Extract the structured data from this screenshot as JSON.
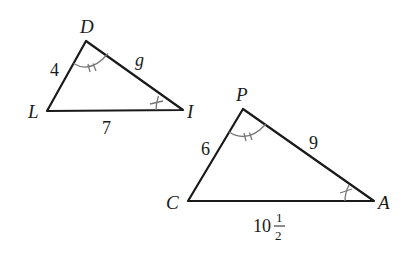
{
  "diagram": {
    "title": "",
    "triangles": [
      {
        "name": "DLI",
        "vertices": [
          {
            "label": "D",
            "x": 86,
            "y": 41
          },
          {
            "label": "L",
            "x": 47,
            "y": 111
          },
          {
            "label": "I",
            "x": 183,
            "y": 110
          }
        ],
        "sides": [
          {
            "between": "DL",
            "label": "4"
          },
          {
            "between": "LI",
            "label": "7"
          },
          {
            "between": "DI",
            "label": "g"
          }
        ],
        "angle_marks": [
          {
            "vertex": "D",
            "ticks": 2
          },
          {
            "vertex": "I",
            "ticks": 1
          }
        ]
      },
      {
        "name": "PCA",
        "vertices": [
          {
            "label": "P",
            "x": 243,
            "y": 109
          },
          {
            "label": "C",
            "x": 188,
            "y": 201
          },
          {
            "label": "A",
            "x": 374,
            "y": 201
          }
        ],
        "sides": [
          {
            "between": "PC",
            "label": "6"
          },
          {
            "between": "CA",
            "label_whole": "10",
            "label_num": "1",
            "label_den": "2"
          },
          {
            "between": "PA",
            "label": "9"
          }
        ],
        "angle_marks": [
          {
            "vertex": "P",
            "ticks": 2
          },
          {
            "vertex": "A",
            "ticks": 1
          }
        ]
      }
    ],
    "colors": {
      "stroke": "#1a1a1a",
      "angle_mark": "#777777",
      "background": "#ffffff"
    }
  }
}
